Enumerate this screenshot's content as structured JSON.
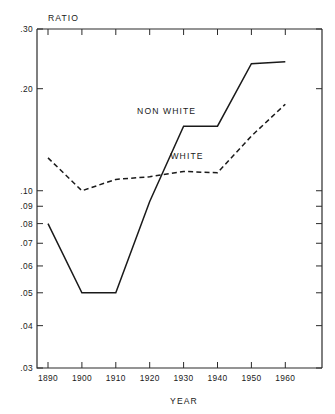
{
  "chart_data": {
    "type": "line",
    "title": "",
    "xlabel": "YEAR",
    "ylabel": "RATIO",
    "yscale": "log",
    "ylim": [
      0.03,
      0.3
    ],
    "xlim": [
      1885,
      1965
    ],
    "grid": false,
    "legend_position": "inline-annotation",
    "x": [
      1890,
      1900,
      1910,
      1920,
      1930,
      1940,
      1950,
      1960
    ],
    "xticklabels": [
      "1890",
      "1900",
      "1910",
      "1920",
      "1930",
      "1940",
      "1950",
      "1960"
    ],
    "yticklabels": [
      ".30",
      ".20",
      ".10",
      ".09",
      ".08",
      ".07",
      ".06",
      ".05",
      ".04",
      ".03"
    ],
    "ytickvalues": [
      0.3,
      0.2,
      0.1,
      0.09,
      0.08,
      0.07,
      0.06,
      0.05,
      0.04,
      0.03
    ],
    "series": [
      {
        "name": "NON WHITE",
        "style": "solid",
        "values": [
          0.08,
          0.05,
          0.05,
          0.093,
          0.155,
          0.155,
          0.237,
          0.24
        ]
      },
      {
        "name": "WHITE",
        "style": "dashed",
        "values": [
          0.125,
          0.1,
          0.108,
          0.11,
          0.114,
          0.113,
          0.145,
          0.18
        ]
      }
    ],
    "annotations": [
      {
        "text": "NON WHITE",
        "x": 1925,
        "y": 0.168
      },
      {
        "text": "WHITE",
        "x": 1931,
        "y": 0.124
      }
    ],
    "colors": {
      "line": "#1a1a1a",
      "axis": "#2b2b2b",
      "background": "#ffffff"
    }
  }
}
